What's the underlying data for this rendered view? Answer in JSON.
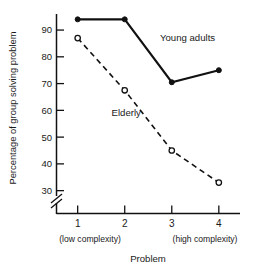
{
  "chart_data": {
    "type": "line",
    "title": "",
    "xlabel": "Problem",
    "ylabel": "Percentage of group solving problem",
    "categories": [
      "1",
      "2",
      "3",
      "4"
    ],
    "x": [
      1,
      2,
      3,
      4
    ],
    "xlim": [
      0.55,
      4.45
    ],
    "ylim": [
      28,
      96
    ],
    "yticks": [
      30,
      40,
      50,
      60,
      70,
      80,
      90
    ],
    "ytick_labels": [
      "30",
      "40",
      "50",
      "60",
      "70",
      "80",
      "90"
    ],
    "xtick_labels": [
      "1",
      "2",
      "3",
      "4"
    ],
    "grid": false,
    "legend_position": "inline-annotation",
    "y_axis_break": true,
    "series": [
      {
        "name": "Young adults",
        "values": [
          94,
          94,
          70.5,
          75
        ],
        "line_style": "solid",
        "marker": "filled-circle",
        "color": "#111111",
        "label_x": 2.75,
        "label_y": 86
      },
      {
        "name": "Elderly",
        "values": [
          87,
          67.5,
          45,
          33
        ],
        "line_style": "dashed",
        "marker": "open-circle",
        "color": "#111111",
        "label_x": 1.72,
        "label_y": 58
      }
    ],
    "annotations": [
      {
        "text": "(low complexity)",
        "position": "below-x1"
      },
      {
        "text": "(high complexity)",
        "position": "below-x4"
      }
    ]
  },
  "axes": {
    "y_label": "Percentage of group solving problem",
    "x_label": "Problem",
    "low_complexity": "(low complexity)",
    "high_complexity": "(high complexity)"
  },
  "colors": {
    "background": "#ffffff",
    "ink": "#111111",
    "text": "#1a1a1a"
  }
}
